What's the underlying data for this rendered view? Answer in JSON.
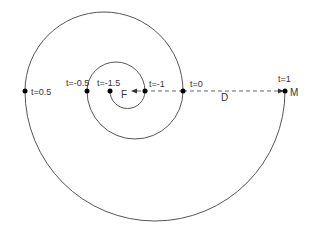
{
  "diagram": {
    "type": "spiral-of-semicircles",
    "points": [
      {
        "id": "t-1.5",
        "label": "t=-1.5"
      },
      {
        "id": "t-1",
        "label": "t=-1"
      },
      {
        "id": "t-0.5",
        "label": "t=-0.5"
      },
      {
        "id": "t0",
        "label": "t=0"
      },
      {
        "id": "t0.5",
        "label": "t=0.5"
      },
      {
        "id": "t1",
        "label": "t=1"
      }
    ],
    "focus_label": "F",
    "moving_point_label": "M",
    "distance_label": "D",
    "colors": {
      "curve": "#555555",
      "dash": "#666666",
      "dot": "#000000",
      "text": "#333333"
    }
  }
}
